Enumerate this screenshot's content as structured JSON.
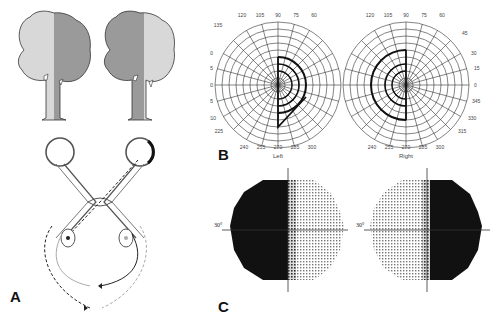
{
  "figure": {
    "panels": [
      {
        "id": "A",
        "label": "A",
        "description": "Trees viewed with left/right hemifield shading; optic chiasm pathway diagram"
      },
      {
        "id": "B",
        "label": "B",
        "description": "Goldmann perimetry plots showing bitemporal hemianopia"
      },
      {
        "id": "C",
        "label": "C",
        "description": "Automated perimetry grayscale plots"
      }
    ],
    "colors": {
      "tree_light": "#d8d8d8",
      "tree_dark": "#9a9a9a",
      "outline": "#333333",
      "defect": "#111111"
    }
  },
  "panel_a": {
    "label": "A"
  },
  "panel_b": {
    "label": "B",
    "left_eye": {
      "caption": "Left",
      "radial_labels_top": [
        "120",
        "105",
        "90",
        "75",
        "60"
      ],
      "radial_labels_left": [
        "135",
        "150",
        "165",
        "180",
        "195",
        "210",
        "225"
      ],
      "radial_labels_bottom": [
        "240",
        "255",
        "270",
        "285",
        "300"
      ],
      "ring_labels": [
        "60",
        "50",
        "40",
        "30",
        "20",
        "10"
      ]
    },
    "right_eye": {
      "caption": "Right",
      "radial_labels_top": [
        "120",
        "105",
        "90",
        "75",
        "60"
      ],
      "radial_labels_right": [
        "45",
        "30",
        "15",
        "0",
        "345",
        "330",
        "315"
      ],
      "radial_labels_bottom": [
        "240",
        "255",
        "270",
        "285",
        "300"
      ],
      "ring_labels": [
        "60",
        "50",
        "40",
        "30",
        "20",
        "10"
      ]
    }
  },
  "panel_c": {
    "label": "C",
    "left_plot": {
      "axis_label": "30°",
      "dark_side": "left"
    },
    "right_plot": {
      "axis_label": "30°",
      "dark_side": "right"
    }
  }
}
